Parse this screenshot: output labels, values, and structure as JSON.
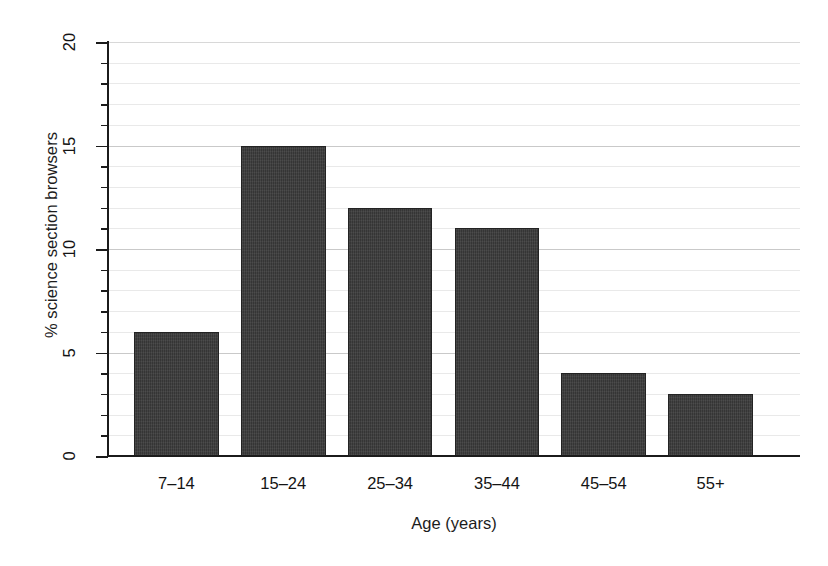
{
  "chart_data": {
    "type": "bar",
    "title": "",
    "categories": [
      "7–14",
      "15–24",
      "25–34",
      "35–44",
      "45–54",
      "55+"
    ],
    "values": [
      6,
      15,
      12,
      11,
      4,
      3
    ],
    "xlabel": "Age (years)",
    "ylabel": "% science section browsers",
    "ylim": [
      0,
      20
    ],
    "ytick_labels": [
      "0",
      "5",
      "10",
      "15",
      "20"
    ],
    "ytick_values": [
      0,
      5,
      10,
      15,
      20
    ],
    "minor_tick_step": 1,
    "grid": "horizontal",
    "legend": "none",
    "bar_color": "#3b3b3b",
    "grid_color": "#e9e9e9",
    "axis_color": "#1b1b1b",
    "background": "#ffffff"
  }
}
